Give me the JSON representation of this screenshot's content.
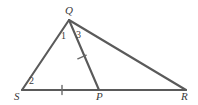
{
  "figure": {
    "type": "geometry-diagram",
    "width": 198,
    "height": 105,
    "background_color": "#ffffff",
    "stroke_color": "#5a5a5a",
    "text_color": "#3a3a3a"
  },
  "vertices": [
    {
      "name": "Q",
      "label": "Q",
      "x": 69,
      "y": 20,
      "label_x": 65,
      "label_y": 6
    },
    {
      "name": "S",
      "label": "S",
      "x": 22,
      "y": 90,
      "label_x": 15,
      "label_y": 92
    },
    {
      "name": "P",
      "label": "P",
      "x": 99,
      "y": 90,
      "label_x": 96,
      "label_y": 92
    },
    {
      "name": "R",
      "label": "R",
      "x": 186,
      "y": 90,
      "label_x": 181,
      "label_y": 92
    }
  ],
  "segments": [
    {
      "name": "SQ",
      "from": "S",
      "to": "Q",
      "x1": 22,
      "y1": 90,
      "x2": 69,
      "y2": 20,
      "ticks": 0
    },
    {
      "name": "QR",
      "from": "Q",
      "to": "R",
      "x1": 69,
      "y1": 20,
      "x2": 186,
      "y2": 90,
      "ticks": 0
    },
    {
      "name": "SR",
      "from": "S",
      "to": "R",
      "x1": 22,
      "y1": 90,
      "x2": 186,
      "y2": 90,
      "ticks": 0
    },
    {
      "name": "QP",
      "from": "Q",
      "to": "P",
      "x1": 69,
      "y1": 20,
      "x2": 99,
      "y2": 90,
      "ticks": 1
    },
    {
      "name": "SP",
      "from": "S",
      "to": "P",
      "x1": 22,
      "y1": 90,
      "x2": 99,
      "y2": 90,
      "ticks": 1
    }
  ],
  "tick_marks": [
    {
      "name": "tick-on-SP",
      "on_segment": "SP",
      "x": 62,
      "y": 90,
      "angle_deg": 90
    },
    {
      "name": "tick-on-QP",
      "on_segment": "QP",
      "x": 82,
      "y": 57,
      "angle_deg": 22
    }
  ],
  "angle_labels": [
    {
      "name": "angle-1",
      "label": "1",
      "at_vertex": "Q",
      "x": 61,
      "y": 31
    },
    {
      "name": "angle-3",
      "label": "3",
      "at_vertex": "Q",
      "x": 76,
      "y": 30
    },
    {
      "name": "angle-2",
      "label": "2",
      "at_vertex": "S",
      "x": 29,
      "y": 76
    }
  ]
}
